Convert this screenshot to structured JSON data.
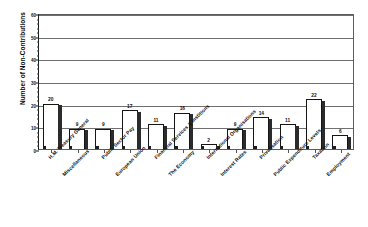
{
  "chart_data": {
    "type": "bar",
    "title": "",
    "xlabel": "",
    "ylabel": "Number of Non-Contributions",
    "ylim": [
      0,
      60
    ],
    "ytick_values": [
      0,
      10,
      20,
      30,
      40,
      50,
      60
    ],
    "ytick_labels": [
      "0",
      "10",
      "20",
      "30",
      "40",
      "50",
      "60"
    ],
    "grid": true,
    "legend": false,
    "categories": [
      "H.M. Treasury General",
      "Miscellaneous",
      "Public Sector Pay",
      "European Union",
      "Financial Services & Institions",
      "The Economy",
      "International Organisations",
      "Interest Rates",
      "Privatisation",
      "Public Expenditure Levels",
      "Taxation",
      "Employment"
    ],
    "values": [
      20,
      9,
      9,
      17,
      11,
      16,
      2,
      9,
      14,
      11,
      22,
      6
    ],
    "bar_style": {
      "fill": "#ffffff",
      "outline": "#151515",
      "shade": "#2b2b2b"
    }
  }
}
